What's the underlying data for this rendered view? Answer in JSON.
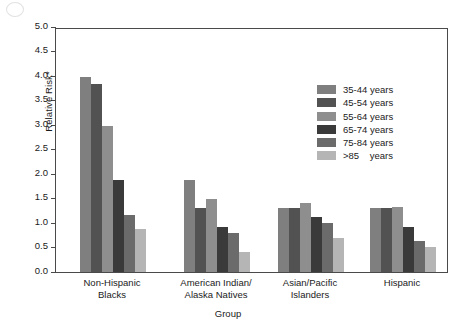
{
  "chart_data": {
    "type": "bar",
    "title": "",
    "xlabel": "Group",
    "ylabel": "Relative Risk*",
    "ylim": [
      0.0,
      5.0
    ],
    "ytick_step": 0.5,
    "grid": false,
    "legend_position": "upper-right-inside",
    "categories": [
      "Non-Hispanic\nBlacks",
      "American Indian/\nAlaska Natives",
      "Asian/Pacific\nIslanders",
      "Hispanic"
    ],
    "ytick_labels": [
      "0.0",
      "0.5",
      "1.0",
      "1.5",
      "2.0",
      "2.5",
      "3.0",
      "3.5",
      "4.0",
      "4.5",
      "5.0"
    ],
    "series": [
      {
        "name": "35-44 years",
        "color": "#7f7f7f",
        "values": [
          3.97,
          1.87,
          1.31,
          1.3
        ]
      },
      {
        "name": "45-54 years",
        "color": "#525252",
        "values": [
          3.84,
          1.3,
          1.3,
          1.3
        ]
      },
      {
        "name": "55-64 years",
        "color": "#8e8e8e",
        "values": [
          2.98,
          1.5,
          1.41,
          1.32
        ]
      },
      {
        "name": "65-74 years",
        "color": "#3a3a3a",
        "values": [
          1.87,
          0.91,
          1.12,
          0.92
        ]
      },
      {
        "name": "75-84 years",
        "color": "#6b6b6b",
        "values": [
          1.17,
          0.8,
          1.0,
          0.63
        ]
      },
      {
        "name": ">85    years",
        "color": "#b5b5b5",
        "values": [
          0.87,
          0.4,
          0.7,
          0.51
        ]
      }
    ]
  }
}
